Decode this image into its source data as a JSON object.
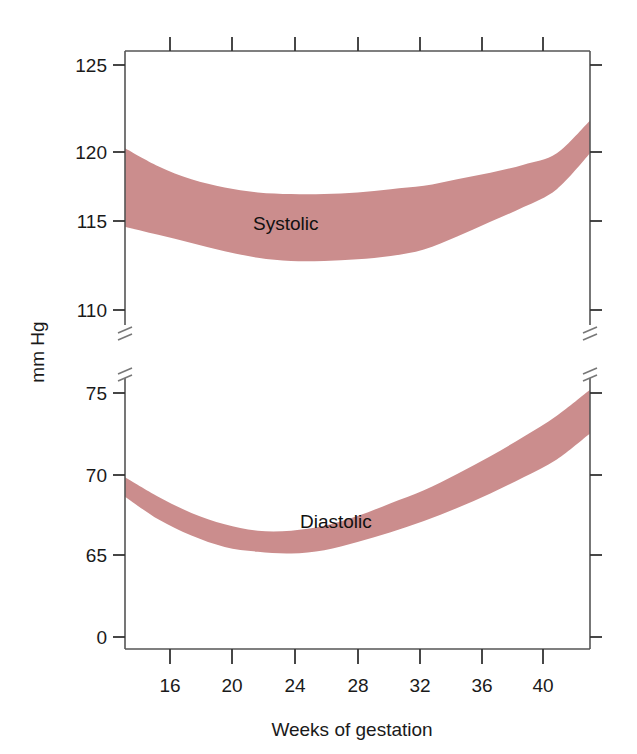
{
  "chart_data": {
    "type": "area",
    "title": "",
    "subtitle": "",
    "xlabel": "Weeks of gestation",
    "ylabel": "mm Hg",
    "grid": false,
    "legend_position": "inline-annotation",
    "panels": [
      {
        "name": "systolic",
        "annotation": "Systolic",
        "ylim": [
          108.5,
          126.5
        ],
        "yticks": [
          125,
          120,
          115,
          110
        ],
        "ytick_labels": [
          "125",
          "120",
          "115",
          "110"
        ],
        "axis_break_below": true,
        "x": [
          14,
          16,
          18,
          20,
          22,
          24,
          26,
          28,
          30,
          32,
          34,
          36,
          38,
          40,
          42
        ],
        "upper": [
          119.9,
          118.8,
          118.0,
          117.5,
          117.2,
          117.1,
          117.1,
          117.2,
          117.4,
          117.6,
          118.0,
          118.4,
          118.9,
          119.6,
          121.6
        ],
        "lower": [
          115.1,
          114.6,
          114.1,
          113.6,
          113.2,
          113.0,
          113.0,
          113.1,
          113.3,
          113.7,
          114.5,
          115.4,
          116.3,
          117.4,
          119.6
        ]
      },
      {
        "name": "diastolic",
        "annotation": "Diastolic",
        "ylim": [
          0,
          77
        ],
        "yticks": [
          75,
          70,
          65,
          0
        ],
        "ytick_labels": [
          "75",
          "70",
          "65",
          "0"
        ],
        "axis_break_above": true,
        "x": [
          14,
          16,
          18,
          20,
          22,
          24,
          26,
          28,
          30,
          32,
          34,
          36,
          38,
          40,
          42
        ],
        "upper": [
          69.8,
          68.6,
          67.6,
          66.9,
          66.5,
          66.5,
          66.8,
          67.4,
          68.2,
          69.0,
          70.0,
          71.1,
          72.3,
          73.6,
          75.2
        ],
        "lower": [
          68.6,
          67.2,
          66.2,
          65.5,
          65.2,
          65.1,
          65.3,
          65.8,
          66.4,
          67.1,
          67.9,
          68.8,
          69.8,
          70.9,
          72.5
        ]
      }
    ],
    "xticks": [
      16,
      20,
      24,
      28,
      32,
      36,
      40
    ],
    "xtick_labels": [
      "16",
      "20",
      "24",
      "28",
      "32",
      "36",
      "40"
    ],
    "xlim": [
      14,
      42
    ],
    "band_color": "#cb8d8d",
    "axis_color": "#555555",
    "text_color": "#1a1a1a"
  }
}
